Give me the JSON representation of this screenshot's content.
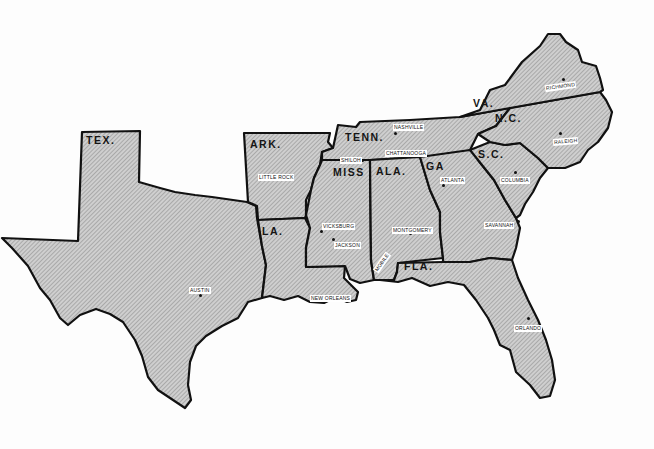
{
  "map": {
    "title": "Confederate States Map",
    "colors": {
      "fill": "#c9c9c9",
      "stroke": "#111111",
      "hatch": "#8a8a8a",
      "background": "#ffffff"
    },
    "states": [
      {
        "abbr": "TEX.",
        "x": 84,
        "y": 135
      },
      {
        "abbr": "ARK.",
        "x": 250,
        "y": 140
      },
      {
        "abbr": "LA.",
        "x": 262,
        "y": 227
      },
      {
        "abbr": "MISS",
        "x": 333,
        "y": 169
      },
      {
        "abbr": "TENN.",
        "x": 345,
        "y": 133
      },
      {
        "abbr": "ALA.",
        "x": 376,
        "y": 167
      },
      {
        "abbr": "GA",
        "x": 426,
        "y": 162
      },
      {
        "abbr": "S.C.",
        "x": 478,
        "y": 150
      },
      {
        "abbr": "N.C.",
        "x": 495,
        "y": 103
      },
      {
        "abbr": "VA.",
        "x": 474,
        "y": 99
      },
      {
        "abbr": "FLA.",
        "x": 400,
        "y": 262
      }
    ],
    "cities": [
      {
        "name": "RICHMOND",
        "lx": 547,
        "ly": 83,
        "dx": 563,
        "dy": 78
      },
      {
        "name": "RALEIGH",
        "lx": 553,
        "ly": 138,
        "dx": 560,
        "dy": 132
      },
      {
        "name": "NASHVILLE",
        "lx": 393,
        "ly": 124,
        "dx": 395,
        "dy": 133
      },
      {
        "name": "CHATTANOOGA",
        "lx": 385,
        "ly": 150,
        "dx": 422,
        "dy": 155
      },
      {
        "name": "SHILOH",
        "lx": 340,
        "ly": 157,
        "dx": 362,
        "dy": 160
      },
      {
        "name": "COLUMBIA",
        "lx": 500,
        "ly": 177,
        "dx": 515,
        "dy": 172
      },
      {
        "name": "ATLANTA",
        "lx": 440,
        "ly": 177,
        "dx": 443,
        "dy": 184
      },
      {
        "name": "SAVANNAH",
        "lx": 484,
        "ly": 222,
        "dx": 518,
        "dy": 220
      },
      {
        "name": "LITTLE ROCK",
        "lx": 258,
        "ly": 174,
        "dx": 285,
        "dy": 178
      },
      {
        "name": "VICKSBURG",
        "lx": 322,
        "ly": 223,
        "dx": 322,
        "dy": 232
      },
      {
        "name": "JACKSON",
        "lx": 333,
        "ly": 242,
        "dx": 333,
        "dy": 238
      },
      {
        "name": "MONTGOMERY",
        "lx": 392,
        "ly": 227,
        "dx": 410,
        "dy": 233
      },
      {
        "name": "MOBILE",
        "lx": 374,
        "ly": 255,
        "dx": 380,
        "dy": 267
      },
      {
        "name": "NEW ORLEANS",
        "lx": 310,
        "ly": 295,
        "dx": 345,
        "dy": 295
      },
      {
        "name": "AUSTIN",
        "lx": 189,
        "ly": 288,
        "dx": 200,
        "dy": 294
      },
      {
        "name": "ORLANDO",
        "lx": 514,
        "ly": 326,
        "dx": 527,
        "dy": 319
      }
    ]
  }
}
